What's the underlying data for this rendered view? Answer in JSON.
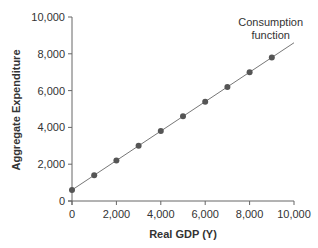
{
  "chart_data": {
    "type": "line",
    "title": "",
    "xlabel": "Real GDP (Y)",
    "ylabel": "Aggregate Expenditure",
    "xlim": [
      0,
      10000
    ],
    "ylim": [
      0,
      10000
    ],
    "x_ticks": [
      0,
      2000,
      4000,
      6000,
      8000,
      10000
    ],
    "x_tick_labels": [
      "0",
      "2,000",
      "4,000",
      "6,000",
      "8,000",
      "10,000"
    ],
    "y_ticks": [
      0,
      2000,
      4000,
      6000,
      8000,
      10000
    ],
    "y_tick_labels": [
      "0",
      "2,000",
      "4,000",
      "6,000",
      "8,000",
      "10,000"
    ],
    "grid": false,
    "legend": null,
    "series": [
      {
        "name": "Consumption function",
        "x": [
          0,
          1000,
          2000,
          3000,
          4000,
          5000,
          6000,
          7000,
          8000,
          9000
        ],
        "values": [
          600,
          1400,
          2200,
          3000,
          3800,
          4600,
          5400,
          6200,
          7000,
          7800
        ],
        "line_extends_to": {
          "x": 10000,
          "y": 8600
        },
        "markers": true,
        "color": "#555555"
      }
    ],
    "annotations": [
      {
        "text": [
          "Consumption",
          "function"
        ],
        "x": 9400,
        "y": 9300
      }
    ]
  }
}
